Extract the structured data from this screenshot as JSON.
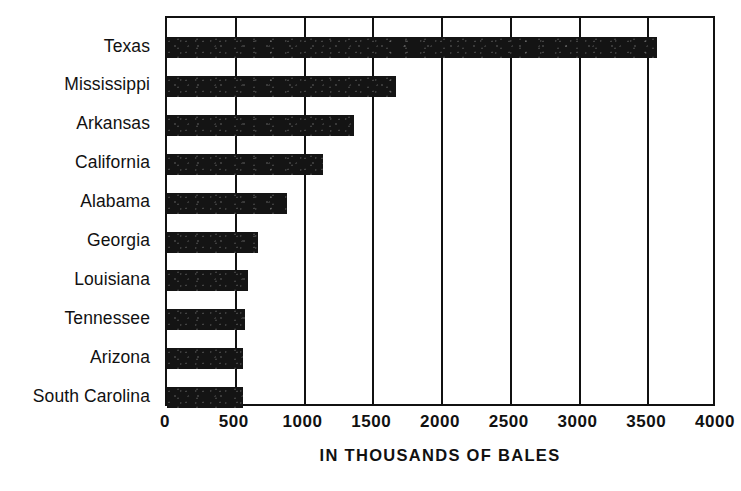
{
  "chart_data": {
    "type": "bar",
    "orientation": "horizontal",
    "title": "",
    "xlabel": "IN THOUSANDS OF BALES",
    "ylabel": "",
    "categories": [
      "Texas",
      "Mississippi",
      "Arkansas",
      "California",
      "Alabama",
      "Georgia",
      "Louisiana",
      "Tennessee",
      "Arizona",
      "South Carolina"
    ],
    "values": [
      3560,
      1665,
      1360,
      1135,
      875,
      660,
      590,
      570,
      550,
      555
    ],
    "xlim": [
      0,
      4000
    ],
    "xticks": [
      0,
      500,
      1000,
      1500,
      2000,
      2500,
      3000,
      3500,
      4000
    ],
    "xtick_labels": [
      "0",
      "500",
      "1000",
      "1500",
      "2000",
      "2500",
      "3000",
      "3500",
      "4000"
    ],
    "grid": true,
    "grid_axis": "x",
    "legend": null,
    "bar_color": "#141414",
    "axis_color": "#111111",
    "background_color": "#ffffff"
  },
  "axis": {
    "x_title": "IN THOUSANDS OF BALES"
  }
}
